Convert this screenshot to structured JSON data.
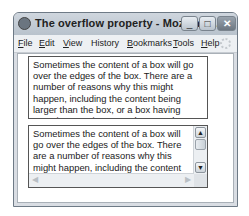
{
  "window": {
    "title": "The overflow property - Mozilla Fi...",
    "controls": {
      "minimize": "_",
      "maximize": "□",
      "close": "✕"
    }
  },
  "menu": {
    "items": [
      {
        "label": "File",
        "accel": "F",
        "rest": "ile"
      },
      {
        "label": "Edit",
        "accel": "E",
        "rest": "dit"
      },
      {
        "label": "View",
        "accel": "V",
        "rest": "iew"
      },
      {
        "label": "History",
        "accel": "",
        "rest": "History"
      },
      {
        "label": "Bookmarks",
        "accel": "B",
        "rest": "ookmarks"
      },
      {
        "label": "Tools",
        "accel": "T",
        "rest": "ools"
      },
      {
        "label": "Help",
        "accel": "H",
        "rest": "elp"
      }
    ]
  },
  "content": {
    "hidden_box": {
      "overflow": "hidden",
      "text": "Sometimes the content of a box will go over the edges of the box. There are a number of reasons why this might happen, including the content being larger than the box, or a box having negative margins. In such cases the overflow property can be used to control what happens."
    },
    "scroll_box": {
      "overflow": "scroll",
      "text": "Sometimes the content of a box will go over the edges of the box. There are a number of reasons why this might happen, including the content being larger than the box, or a box having negative margins.",
      "scroll_up": "▲",
      "scroll_down": "▼",
      "scroll_left": "◀",
      "scroll_right": "▶"
    }
  }
}
